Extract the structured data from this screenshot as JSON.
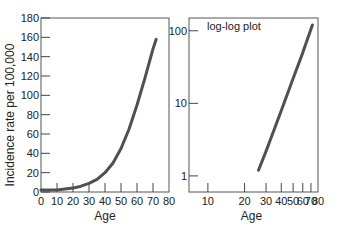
{
  "chart_data": [
    {
      "type": "line",
      "title": "",
      "xlabel": "Age",
      "ylabel": "Incidence rate per 100,000",
      "xlim": [
        0,
        80
      ],
      "ylim": [
        0,
        180
      ],
      "xticks": [
        0,
        10,
        20,
        30,
        40,
        50,
        60,
        70,
        80
      ],
      "yticks": [
        0,
        20,
        40,
        60,
        80,
        100,
        120,
        140,
        160,
        180
      ],
      "grid": false,
      "series": [
        {
          "name": "incidence",
          "x": [
            0,
            10,
            20,
            25,
            30,
            35,
            40,
            45,
            50,
            55,
            60,
            65,
            70,
            72
          ],
          "y": [
            2,
            2,
            4,
            6,
            9,
            13,
            20,
            30,
            45,
            65,
            90,
            118,
            148,
            158
          ]
        }
      ]
    },
    {
      "type": "line",
      "title": "log-log plot",
      "xlabel": "Age",
      "ylabel": "",
      "xscale": "log",
      "yscale": "log",
      "xlim": [
        7,
        80
      ],
      "ylim": [
        0.6,
        150
      ],
      "xticks": [
        10,
        20,
        30,
        40,
        50,
        60,
        70,
        80
      ],
      "yticks": [
        1,
        10,
        100
      ],
      "grid": false,
      "series": [
        {
          "name": "incidence (log-log)",
          "x": [
            26,
            30,
            40,
            50,
            60,
            72
          ],
          "y": [
            1.2,
            2.2,
            8,
            22,
            50,
            120
          ]
        }
      ]
    }
  ],
  "labels": {
    "left_ylabel": "Incidence rate per 100,000",
    "left_xlabel": "Age",
    "right_xlabel": "Age",
    "right_note": "log-log plot"
  }
}
